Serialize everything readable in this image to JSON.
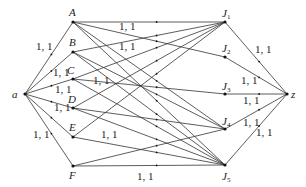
{
  "diagram": {
    "type": "flow-network",
    "nodes": [
      {
        "id": "a",
        "label": "a",
        "x": 25,
        "y": 94,
        "lx": 12,
        "ly": 98
      },
      {
        "id": "A",
        "label": "A",
        "x": 73,
        "y": 22,
        "lx": 69,
        "ly": 16
      },
      {
        "id": "B",
        "label": "B",
        "x": 73,
        "y": 52,
        "lx": 69,
        "ly": 46
      },
      {
        "id": "C",
        "label": "C",
        "x": 73,
        "y": 79,
        "lx": 67,
        "ly": 74
      },
      {
        "id": "D",
        "label": "D",
        "x": 73,
        "y": 108,
        "lx": 68,
        "ly": 103
      },
      {
        "id": "E",
        "label": "E",
        "x": 73,
        "y": 137,
        "lx": 69,
        "ly": 131
      },
      {
        "id": "F",
        "label": "F",
        "x": 73,
        "y": 166,
        "lx": 69,
        "ly": 179
      },
      {
        "id": "J1",
        "label": "J",
        "sub": "1",
        "x": 225,
        "y": 22,
        "lx": 222,
        "ly": 17
      },
      {
        "id": "J2",
        "label": "J",
        "sub": "2",
        "x": 225,
        "y": 57,
        "lx": 222,
        "ly": 52
      },
      {
        "id": "J3",
        "label": "J",
        "sub": "3",
        "x": 225,
        "y": 94,
        "lx": 222,
        "ly": 90
      },
      {
        "id": "J4",
        "label": "J",
        "sub": "4",
        "x": 225,
        "y": 129,
        "lx": 222,
        "ly": 125
      },
      {
        "id": "J5",
        "label": "J",
        "sub": "5",
        "x": 225,
        "y": 165,
        "lx": 222,
        "ly": 180
      },
      {
        "id": "z",
        "label": "z",
        "x": 287,
        "y": 94,
        "lx": 291,
        "ly": 98
      }
    ],
    "edges": [
      {
        "from": "a",
        "to": "A"
      },
      {
        "from": "a",
        "to": "B"
      },
      {
        "from": "a",
        "to": "C"
      },
      {
        "from": "a",
        "to": "D"
      },
      {
        "from": "a",
        "to": "E"
      },
      {
        "from": "a",
        "to": "F"
      },
      {
        "from": "A",
        "to": "J1"
      },
      {
        "from": "A",
        "to": "J2"
      },
      {
        "from": "A",
        "to": "J4"
      },
      {
        "from": "A",
        "to": "J5"
      },
      {
        "from": "B",
        "to": "J1"
      },
      {
        "from": "B",
        "to": "J4"
      },
      {
        "from": "B",
        "to": "J5"
      },
      {
        "from": "C",
        "to": "J1"
      },
      {
        "from": "C",
        "to": "J3"
      },
      {
        "from": "C",
        "to": "J5"
      },
      {
        "from": "D",
        "to": "J1"
      },
      {
        "from": "D",
        "to": "J4"
      },
      {
        "from": "D",
        "to": "J5"
      },
      {
        "from": "E",
        "to": "J1"
      },
      {
        "from": "E",
        "to": "J5"
      },
      {
        "from": "F",
        "to": "J4"
      },
      {
        "from": "F",
        "to": "J5"
      },
      {
        "from": "J1",
        "to": "z"
      },
      {
        "from": "J2",
        "to": "z"
      },
      {
        "from": "J3",
        "to": "z"
      },
      {
        "from": "J4",
        "to": "z"
      },
      {
        "from": "J5",
        "to": "z"
      }
    ],
    "edge_labels": [
      {
        "text": "1, 1",
        "x": 36,
        "y": 50
      },
      {
        "text": "1, 1",
        "x": 53,
        "y": 76
      },
      {
        "text": "1, 1",
        "x": 55,
        "y": 93
      },
      {
        "text": "1, 1",
        "x": 54,
        "y": 111
      },
      {
        "text": "1, 1",
        "x": 33,
        "y": 138
      },
      {
        "text": "1, 1",
        "x": 119,
        "y": 30
      },
      {
        "text": "1, 1",
        "x": 119,
        "y": 50
      },
      {
        "text": "1, 1",
        "x": 93,
        "y": 84
      },
      {
        "text": "1, 1",
        "x": 101,
        "y": 138
      },
      {
        "text": "1, 1",
        "x": 137,
        "y": 180
      },
      {
        "text": "1, 1",
        "x": 255,
        "y": 53
      },
      {
        "text": "1, 1",
        "x": 241,
        "y": 84
      },
      {
        "text": "1, 1",
        "x": 243,
        "y": 104
      },
      {
        "text": "1, 1",
        "x": 243,
        "y": 126
      },
      {
        "text": "1, 1",
        "x": 256,
        "y": 136
      }
    ]
  }
}
